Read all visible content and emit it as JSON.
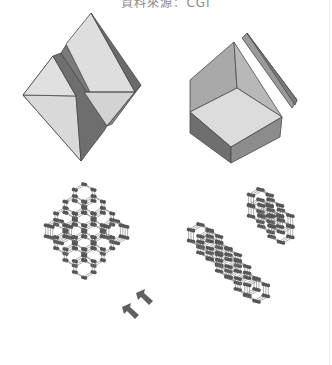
{
  "figure": {
    "caption": "資料來源：CGI",
    "panels": [
      {
        "id": "cleaved-crystal-left",
        "description": "Crystal cleaved along plane (two halves)"
      },
      {
        "id": "cleaved-crystal-right",
        "description": "Hexagonal crystal with cleaved slab"
      },
      {
        "id": "lattice-left",
        "description": "Diamond-type atomic lattice with cleavage arrows"
      },
      {
        "id": "lattice-right",
        "description": "Lattice split into two pieces along cleavage plane"
      }
    ],
    "arrows": {
      "count": 2,
      "direction": "up-left",
      "icon": "arrow-icon"
    },
    "colors": {
      "face_light": "#d8d8d8",
      "face_mid": "#a8a8a8",
      "face_dark": "#6a6a6a",
      "edge": "#4a4a4a",
      "atom": "#555555",
      "bond": "#7a7a7a",
      "arrow": "#606060",
      "caption": "#8a8a8a"
    }
  }
}
